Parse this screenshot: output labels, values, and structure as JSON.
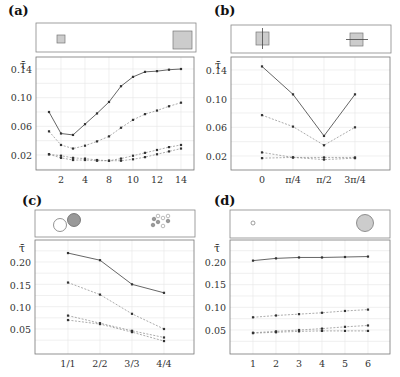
{
  "figure": {
    "y_symbol": "τ̄",
    "panels": [
      {
        "id": "a",
        "label": "(a)"
      },
      {
        "id": "b",
        "label": "(b)"
      },
      {
        "id": "c",
        "label": "(c)"
      },
      {
        "id": "d",
        "label": "(d)"
      }
    ]
  },
  "chart_data": [
    {
      "panel": "(a)",
      "type": "line",
      "title": "",
      "xlabel": "",
      "ylabel": "τ̄",
      "x_tick_labels": [
        "2",
        "4",
        "8",
        "10",
        "12",
        "14"
      ],
      "x_tick_positions": [
        2,
        4,
        6,
        8,
        10,
        12
      ],
      "y_tick_labels": [
        "0.02",
        "0.06",
        "0.10",
        "0.14"
      ],
      "ylim": [
        0.0,
        0.152
      ],
      "grid": true,
      "inset": "two gray squares, small at left and large at right",
      "x": [
        1,
        2,
        3,
        4,
        5,
        6,
        7,
        8,
        9,
        10,
        11,
        12
      ],
      "series": [
        {
          "name": "solid",
          "style": "solid",
          "values": [
            0.08,
            0.05,
            0.048,
            0.063,
            0.078,
            0.094,
            0.116,
            0.129,
            0.136,
            0.137,
            0.139,
            0.14
          ]
        },
        {
          "name": "dashed-1",
          "style": "dashed",
          "values": [
            0.053,
            0.034,
            0.029,
            0.033,
            0.039,
            0.046,
            0.058,
            0.069,
            0.077,
            0.082,
            0.088,
            0.093
          ]
        },
        {
          "name": "dashed-2",
          "style": "dashed",
          "values": [
            0.021,
            0.019,
            0.016,
            0.015,
            0.013,
            0.012,
            0.015,
            0.019,
            0.023,
            0.027,
            0.031,
            0.034
          ]
        },
        {
          "name": "dashed-3",
          "style": "dashed",
          "values": [
            0.021,
            0.016,
            0.013,
            0.013,
            0.012,
            0.012,
            0.012,
            0.014,
            0.017,
            0.021,
            0.025,
            0.029
          ]
        }
      ]
    },
    {
      "panel": "(b)",
      "type": "line",
      "title": "",
      "xlabel": "",
      "ylabel": "τ̄",
      "categories": [
        "0",
        "π/4",
        "π/2",
        "3π/4"
      ],
      "y_tick_labels": [
        "0.02",
        "0.06",
        "0.10",
        "0.14"
      ],
      "ylim": [
        0.0,
        0.152
      ],
      "grid": true,
      "inset": "two gray squares, left with vertical line, right with horizontal line",
      "series": [
        {
          "name": "solid",
          "style": "solid",
          "values": [
            0.145,
            0.106,
            0.048,
            0.106
          ]
        },
        {
          "name": "dashed-1",
          "style": "dashed",
          "values": [
            0.077,
            0.061,
            0.035,
            0.06
          ]
        },
        {
          "name": "dashed-2",
          "style": "dashed",
          "values": [
            0.025,
            0.018,
            0.018,
            0.018
          ]
        },
        {
          "name": "dashed-3",
          "style": "dashed",
          "values": [
            0.017,
            0.018,
            0.015,
            0.017
          ]
        }
      ]
    },
    {
      "panel": "(c)",
      "type": "line",
      "title": "",
      "xlabel": "",
      "ylabel": "τ̄",
      "categories": [
        "1/1",
        "2/2",
        "3/3",
        "4/4"
      ],
      "y_tick_labels": [
        "0.05",
        "0.10",
        "0.15",
        "0.20"
      ],
      "ylim": [
        0.0,
        0.25
      ],
      "grid": true,
      "inset": "one white and one gray circle at left; cluster of four white and four gray small circles at right",
      "series": [
        {
          "name": "solid",
          "style": "solid",
          "values": [
            0.22,
            0.204,
            0.15,
            0.131
          ]
        },
        {
          "name": "dashed-1",
          "style": "dashed",
          "values": [
            0.154,
            0.127,
            0.084,
            0.05
          ]
        },
        {
          "name": "dashed-2",
          "style": "dashed",
          "values": [
            0.08,
            0.063,
            0.046,
            0.031
          ]
        },
        {
          "name": "dashed-3",
          "style": "dashed",
          "values": [
            0.07,
            0.061,
            0.043,
            0.023
          ]
        }
      ]
    },
    {
      "panel": "(d)",
      "type": "line",
      "title": "",
      "xlabel": "",
      "ylabel": "τ̄",
      "categories": [
        "1",
        "2",
        "3",
        "4",
        "5",
        "6"
      ],
      "y_tick_labels": [
        "0.05",
        "0.10",
        "0.15",
        "0.20"
      ],
      "ylim": [
        0.0,
        0.25
      ],
      "grid": true,
      "inset": "tiny circle at left, large gray circle at right",
      "series": [
        {
          "name": "solid",
          "style": "solid",
          "values": [
            0.203,
            0.208,
            0.21,
            0.21,
            0.211,
            0.212
          ]
        },
        {
          "name": "dashed-1",
          "style": "dashed",
          "values": [
            0.078,
            0.082,
            0.085,
            0.088,
            0.092,
            0.095
          ]
        },
        {
          "name": "dashed-2",
          "style": "dashed",
          "values": [
            0.044,
            0.047,
            0.05,
            0.053,
            0.057,
            0.06
          ]
        },
        {
          "name": "dashed-3",
          "style": "dashed",
          "values": [
            0.043,
            0.045,
            0.047,
            0.048,
            0.048,
            0.048
          ]
        }
      ]
    }
  ]
}
